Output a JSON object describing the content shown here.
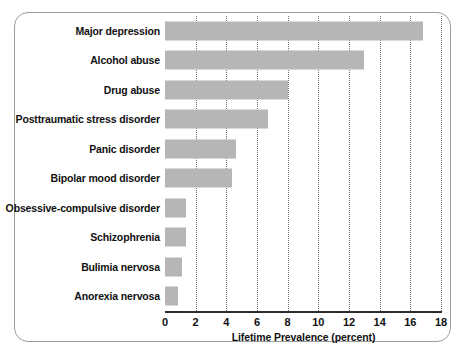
{
  "chart_data": {
    "type": "bar",
    "orientation": "horizontal",
    "title": "",
    "xlabel": "Lifetime Prevalence (percent)",
    "ylabel": "",
    "xlim": [
      0,
      18
    ],
    "xticks": [
      0,
      2,
      4,
      6,
      8,
      10,
      12,
      14,
      16,
      18
    ],
    "xtick_labels": [
      "0",
      "2",
      "4",
      "6",
      "8",
      "10",
      "12",
      "14",
      "16",
      "18"
    ],
    "grid": "vertical-dotted",
    "legend": "none",
    "bar_color": "#b6b6b6",
    "categories": [
      "Major depression",
      "Alcohol abuse",
      "Drug abuse",
      "Posttraumatic stress disorder",
      "Panic disorder",
      "Bipolar mood disorder",
      "Obsessive-compulsive disorder",
      "Schizophrenia",
      "Bulimia nervosa",
      "Anorexia nervosa"
    ],
    "values": [
      16.8,
      13.0,
      8.0,
      6.7,
      4.6,
      4.4,
      1.4,
      1.4,
      1.1,
      0.85
    ]
  },
  "axis": {
    "xlabel": "Lifetime Prevalence (percent)"
  },
  "rows": [
    {
      "label": "Major depression",
      "value": 16.8
    },
    {
      "label": "Alcohol abuse",
      "value": 13.0
    },
    {
      "label": "Drug abuse",
      "value": 8.0
    },
    {
      "label": "Posttraumatic stress disorder",
      "value": 6.7
    },
    {
      "label": "Panic disorder",
      "value": 4.6
    },
    {
      "label": "Bipolar mood disorder",
      "value": 4.4
    },
    {
      "label": "Obsessive-compulsive disorder",
      "value": 1.4
    },
    {
      "label": "Schizophrenia",
      "value": 1.4
    },
    {
      "label": "Bulimia nervosa",
      "value": 1.1
    },
    {
      "label": "Anorexia nervosa",
      "value": 0.85
    }
  ],
  "ticks": [
    {
      "label": "0",
      "value": 0
    },
    {
      "label": "2",
      "value": 2
    },
    {
      "label": "4",
      "value": 4
    },
    {
      "label": "6",
      "value": 6
    },
    {
      "label": "8",
      "value": 8
    },
    {
      "label": "10",
      "value": 10
    },
    {
      "label": "12",
      "value": 12
    },
    {
      "label": "14",
      "value": 14
    },
    {
      "label": "16",
      "value": 16
    },
    {
      "label": "18",
      "value": 18
    }
  ]
}
